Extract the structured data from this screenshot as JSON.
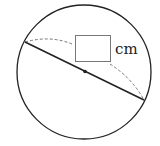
{
  "diagram": {
    "type": "circle-diameter-measure",
    "circle": {
      "cx": 84,
      "cy": 72,
      "r": 67
    },
    "diameter": {
      "x1": 25,
      "y1": 42,
      "x2": 144,
      "y2": 100
    },
    "center_point": {
      "x": 85,
      "y": 71
    },
    "answer_box": {
      "x": 75,
      "y": 35,
      "w": 35,
      "h": 26,
      "value": ""
    },
    "unit_label": "cm",
    "colors": {
      "stroke": "#222222",
      "dashed": "#777777",
      "box": "#777777"
    }
  }
}
